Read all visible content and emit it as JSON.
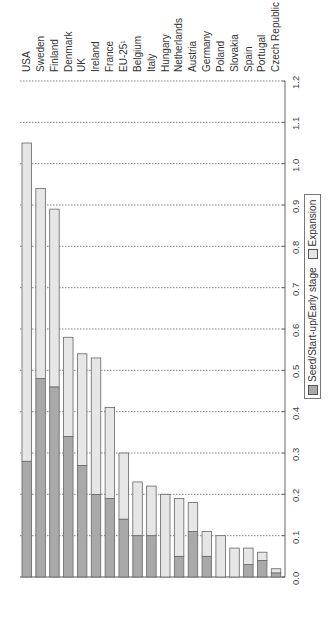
{
  "chart_data": {
    "type": "bar",
    "stacked": true,
    "orientation": "vertical",
    "title": "",
    "xlabel": "",
    "ylabel": "",
    "ylim": [
      0,
      1.2
    ],
    "yticks": [
      "0.0",
      "0.1",
      "0.2",
      "0.3",
      "0.4",
      "0.5",
      "0.6",
      "0.7",
      "0.8",
      "0.9",
      "1.0",
      "1.1",
      "1.2"
    ],
    "grid": "horizontal dotted",
    "legend_position": "right",
    "categories": [
      "USA",
      "Sweden",
      "Finland",
      "Denmark",
      "UK",
      "Ireland",
      "France",
      "EU-25¹",
      "Belgium",
      "Italy",
      "Hungary",
      "Netherlands",
      "Austria",
      "Germany",
      "Poland",
      "Slovakia",
      "Spain",
      "Portugal",
      "Czech Republic"
    ],
    "series": [
      {
        "name": "Seed/Start-up/Early stage",
        "color": "#a9a9a9",
        "values": [
          0.28,
          0.48,
          0.46,
          0.34,
          0.27,
          0.2,
          0.19,
          0.14,
          0.1,
          0.1,
          0.0,
          0.05,
          0.11,
          0.05,
          0.0,
          0.0,
          0.03,
          0.04,
          0.01
        ]
      },
      {
        "name": "Expansion",
        "color": "#e6e6e6",
        "values": [
          0.77,
          0.46,
          0.43,
          0.24,
          0.27,
          0.33,
          0.22,
          0.16,
          0.13,
          0.12,
          0.2,
          0.14,
          0.07,
          0.06,
          0.1,
          0.07,
          0.04,
          0.02,
          0.01
        ]
      }
    ],
    "totals": [
      1.05,
      0.94,
      0.89,
      0.58,
      0.54,
      0.53,
      0.41,
      0.3,
      0.23,
      0.22,
      0.2,
      0.19,
      0.18,
      0.11,
      0.1,
      0.07,
      0.07,
      0.06,
      0.02
    ]
  },
  "legend": {
    "seed_label": "Seed/Start-up/Early stage",
    "expansion_label": "Expansion"
  }
}
